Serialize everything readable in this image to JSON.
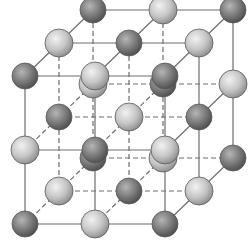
{
  "diagram": {
    "type": "crystal-lattice",
    "colors": {
      "background": "#ffffff",
      "edge": "#6e6e6e",
      "light_sphere": "#c9c9c9",
      "dark_sphere": "#7c7c7c"
    },
    "grid": {
      "origin": [
        25,
        224
      ],
      "x_step": [
        70,
        0
      ],
      "y_step": [
        0,
        -74
      ],
      "z_step": [
        34,
        -33
      ]
    },
    "atoms_count": 27
  }
}
